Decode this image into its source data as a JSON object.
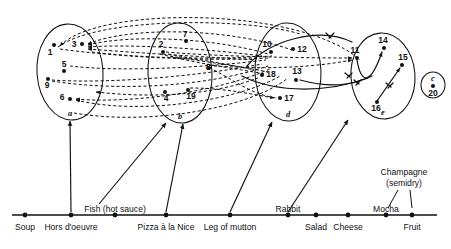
{
  "figure": {
    "stroke_color": "#111111",
    "background_color": "#ffffff"
  },
  "clusters": [
    {
      "id": "a",
      "label": "a",
      "cx": 70,
      "cy": 72,
      "rx": 33,
      "ry": 48,
      "rotation": -4
    },
    {
      "id": "b",
      "label": "b",
      "cx": 180,
      "cy": 73,
      "rx": 32,
      "ry": 50,
      "rotation": -3
    },
    {
      "id": "d",
      "label": "d",
      "cx": 288,
      "cy": 72,
      "rx": 33,
      "ry": 49,
      "rotation": -2
    },
    {
      "id": "e",
      "label": "e",
      "cx": 383,
      "cy": 76,
      "rx": 32,
      "ry": 43,
      "rotation": -4
    },
    {
      "id": "c",
      "label": "c",
      "cx": 433,
      "cy": 85,
      "rx": 12,
      "ry": 13,
      "rotation": 0
    }
  ],
  "nodes": [
    {
      "id": "1",
      "label": "1",
      "x": 54,
      "y": 45,
      "label_dx": -4,
      "label_dy": 10,
      "cluster": "a"
    },
    {
      "id": "3",
      "label": "3",
      "x": 82,
      "y": 44,
      "label_dx": -8,
      "label_dy": 3,
      "cluster": "a"
    },
    {
      "id": "5a",
      "label": "5",
      "x": 64,
      "y": 71,
      "label_dx": 0,
      "label_dy": -4,
      "cluster": "a"
    },
    {
      "id": "9",
      "label": "9",
      "x": 48,
      "y": 79,
      "label_dx": -1,
      "label_dy": 9,
      "cluster": "a"
    },
    {
      "id": "6",
      "label": "6",
      "x": 70,
      "y": 99,
      "label_dx": -8,
      "label_dy": 1,
      "cluster": "a"
    },
    {
      "id": "7",
      "label": "7",
      "x": 186,
      "y": 41,
      "label_dx": -1,
      "label_dy": -4,
      "cluster": "b"
    },
    {
      "id": "2",
      "label": "2",
      "x": 163,
      "y": 52,
      "label_dx": -2,
      "label_dy": -5,
      "cluster": "b"
    },
    {
      "id": "8",
      "label": "8",
      "x": 209,
      "y": 68,
      "label_dx": -1,
      "label_dy": 2,
      "cluster": "b"
    },
    {
      "id": "4",
      "label": "4",
      "x": 165,
      "y": 92,
      "label_dx": 1,
      "label_dy": 9,
      "cluster": "b"
    },
    {
      "id": "19",
      "label": "19",
      "x": 188,
      "y": 90,
      "label_dx": 3,
      "label_dy": 9,
      "cluster": "b"
    },
    {
      "id": "10",
      "label": "10",
      "x": 271,
      "y": 52,
      "label_dx": -4,
      "label_dy": -5,
      "cluster": "d"
    },
    {
      "id": "12",
      "label": "12",
      "x": 293,
      "y": 49,
      "label_dx": 9,
      "label_dy": 3,
      "cluster": "d"
    },
    {
      "id": "18",
      "label": "18",
      "x": 262,
      "y": 75,
      "label_dx": 9,
      "label_dy": 2,
      "cluster": "d"
    },
    {
      "id": "13",
      "label": "13",
      "x": 296,
      "y": 80,
      "label_dx": 1,
      "label_dy": -6,
      "cluster": "d"
    },
    {
      "id": "17",
      "label": "17",
      "x": 280,
      "y": 98,
      "label_dx": 9,
      "label_dy": 3,
      "cluster": "d"
    },
    {
      "id": "11",
      "label": "11",
      "x": 357,
      "y": 58,
      "label_dx": -2,
      "label_dy": -5,
      "cluster": "e"
    },
    {
      "id": "14",
      "label": "14",
      "x": 384,
      "y": 48,
      "label_dx": -1,
      "label_dy": -5,
      "cluster": "e"
    },
    {
      "id": "15",
      "label": "15",
      "x": 402,
      "y": 65,
      "label_dx": 1,
      "label_dy": -5,
      "cluster": "e"
    },
    {
      "id": "16",
      "label": "16",
      "x": 377,
      "y": 102,
      "label_dx": -1,
      "label_dy": 9,
      "cluster": "e"
    },
    {
      "id": "20",
      "label": "20",
      "x": 433,
      "y": 86,
      "label_dx": 0,
      "label_dy": 10,
      "cluster": "c"
    }
  ],
  "axis": {
    "y": 215,
    "x_start": 12,
    "x_end": 437,
    "ticks": [
      {
        "label": "Soup",
        "x": 25,
        "label_y": 230,
        "connector": false
      },
      {
        "label": "Hors d'oeuvre",
        "x": 71,
        "label_y": 230,
        "connector": true,
        "target_x": 70,
        "target_y": 121
      },
      {
        "label": "Fish (hot sauce)",
        "x": 115,
        "label_y": 230,
        "label_offset_y": -18,
        "connector": true,
        "target_x": 166,
        "target_y": 123,
        "leader_from_x": 99,
        "leader_from_y": 204
      },
      {
        "label": "Pizza à la Nice",
        "x": 166,
        "label_y": 230,
        "connector": true,
        "target_x": 183,
        "target_y": 124
      },
      {
        "label": "Leg of mutton",
        "x": 230,
        "label_y": 230,
        "connector": true,
        "target_x": 272,
        "target_y": 122
      },
      {
        "label": "Rabbit",
        "x": 288,
        "label_y": 230,
        "label_offset_y": -18,
        "connector": true,
        "target_x": 348,
        "target_y": 120
      },
      {
        "label": "Salad",
        "x": 316,
        "label_y": 230,
        "connector": false
      },
      {
        "label": "Cheese",
        "x": 348,
        "label_y": 230,
        "connector": false
      },
      {
        "label": "Mocha",
        "x": 386,
        "label_y": 230,
        "label_offset_y": -18,
        "connector": false
      },
      {
        "label": "Fruit",
        "x": 412,
        "label_y": 230,
        "connector": false
      }
    ],
    "callouts": [
      {
        "label": "Champagne",
        "x": 404,
        "y": 175
      },
      {
        "label": "(semidry)",
        "x": 404,
        "y": 186
      }
    ]
  },
  "edges": {
    "dashed_count": 22,
    "solid_count": 5,
    "style": "dashed curved arrows between clusters; solid curved arrows inside cluster e"
  }
}
